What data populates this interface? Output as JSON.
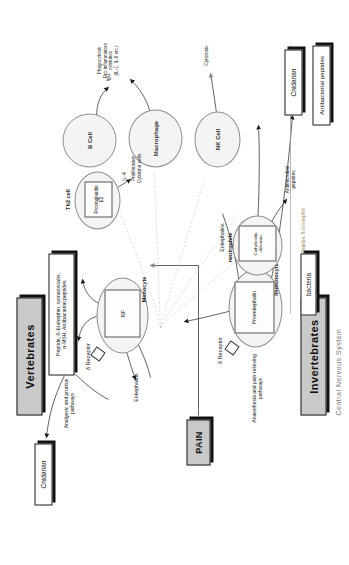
{
  "figure": {
    "side_title": "Central Nervous System"
  },
  "group_boxes": {
    "vertebrates": "Vertebrates",
    "invertebrates": "Invertebrates",
    "pain": "PAIN"
  },
  "organism_boxes": {
    "cnidarian_top": "Cnidarian",
    "cnidarian_bottom": "Cnidarian",
    "antibacterial_peptides": "Antibacterial peptides",
    "bacteria": "bacteria"
  },
  "peptide_box": {
    "text": "Peptide, ß-Endorphin, somatostatin,\nα-MSH, Antibacterial peptides"
  },
  "vertebrate_side": {
    "receptor": "δ Receptor",
    "cell_name": "Monocyte",
    "inner_label": "NF",
    "inner_sub": "κB",
    "pathway_label": "Analgesic and pruritus\npathways",
    "enkephalin_label": "Enkephalins"
  },
  "invertebrate_side": {
    "receptor": "δ Receptor",
    "cell_name": "Immunocyte",
    "inner_label": "Proenkephalin",
    "pathway_label": "Anaesthesia and pain-relieving\npathways",
    "enkephalin_label": "Enkephalins",
    "pept_arrow_label": "Peptide, ß-Endorphin"
  },
  "immune_cells": [
    {
      "name": "Th2 cell",
      "inner": "Prostaglandin\nE2"
    },
    {
      "name": "B Cell",
      "inner": ""
    },
    {
      "name": "Macrophage",
      "inner": ""
    },
    {
      "name": "NK Cell",
      "inner": ""
    },
    {
      "name": "neutrophile",
      "inner": "Cathelicidin,\ndefensin"
    }
  ],
  "annotations": {
    "il4": "IL-4",
    "proliferation": "Proliferation\nCytokine cells",
    "igg": "IgG",
    "phagocytosis": "Phagocytosis\nPro-inflammatory\ncytokines\n(IL-1, IL-6 etc.)",
    "cytotoxic": "Cytotoxic",
    "antimicrobial": "Antimicrobial\npeptides"
  },
  "colors": {
    "group_fill": "#c9c9c9",
    "cell_fill": "#f4f4f4",
    "line": "#9a9a9a",
    "text": "#222222"
  }
}
